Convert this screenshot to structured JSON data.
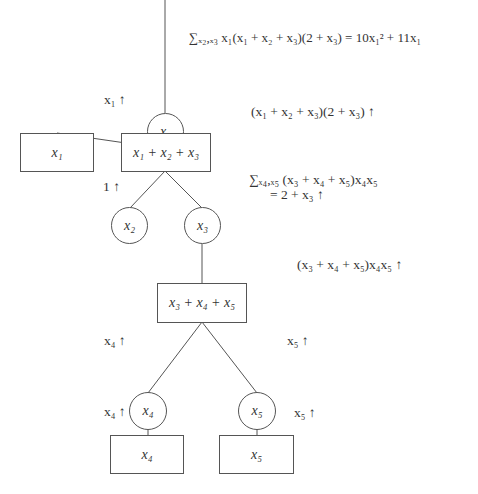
{
  "diagram": {
    "nodes": {
      "x1_var": {
        "type": "circle",
        "label": "x₁"
      },
      "x1_factor": {
        "type": "box",
        "label": "x₁"
      },
      "x1x2x3_factor": {
        "type": "box",
        "label": "x₁ + x₂ + x₃"
      },
      "x2_var": {
        "type": "circle",
        "label": "x₂"
      },
      "x3_var": {
        "type": "circle",
        "label": "x₃"
      },
      "x3x4x5_factor": {
        "type": "box",
        "label": "x₃ + x₄ + x₅"
      },
      "x4_var": {
        "type": "circle",
        "label": "x₄"
      },
      "x5_var": {
        "type": "circle",
        "label": "x₅"
      },
      "x4_factor": {
        "type": "box",
        "label": "x₄"
      },
      "x5_factor": {
        "type": "box",
        "label": "x₅"
      }
    },
    "messages": {
      "root_sum": "∑ₓ₂,ₓ₃ x₁(x₁ + x₂ + x₃)(2 + x₃) = 10x₁² + 11x₁",
      "x1_up": "x₁ ↑",
      "f123_up": "(x₁ + x₂ + x₃)(2 + x₃) ↑",
      "one_up": "1 ↑",
      "x3_sum_line1": "∑ₓ₄,ₓ₅ (x₃ + x₄ + x₅)x₄x₅",
      "x3_sum_line2": "= 2 + x₃ ↑",
      "f345_up": "(x₃ + x₄ + x₅)x₄x₅ ↑",
      "x4_up_upper": "x₄ ↑",
      "x5_up_upper": "x₅ ↑",
      "x4_up_lower": "x₄ ↑",
      "x5_up_lower": "x₅ ↑"
    },
    "colors": {
      "stroke": "#555555",
      "text": "#333333",
      "background": "#ffffff"
    }
  }
}
